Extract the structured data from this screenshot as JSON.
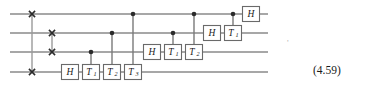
{
  "figure": {
    "kind": "quantum-circuit",
    "equation_number": "(4.59)",
    "stray_mark": "'",
    "wire_count": 4,
    "colors": {
      "wire": "#8a8a8a",
      "gate_border": "#6a6a6a",
      "gate_fill": "#ffffff",
      "control_dot": "#2b2b2b",
      "text": "#1a1a1a",
      "background": "#ffffff"
    },
    "wires": [
      {
        "index": 0,
        "y": 14
      },
      {
        "index": 1,
        "y": 33
      },
      {
        "index": 2,
        "y": 52
      },
      {
        "index": 3,
        "y": 72
      }
    ],
    "wire_span": {
      "x_start": 10,
      "x_end": 268
    },
    "swaps": [
      {
        "name": "swap-q0-q3",
        "x": 32,
        "wire_a": 0,
        "wire_b": 3
      },
      {
        "name": "swap-q1-q2",
        "x": 52,
        "wire_a": 1,
        "wire_b": 2
      }
    ],
    "gates": [
      {
        "id": "g-h-w3",
        "label": "H",
        "sub": "",
        "wire": 3,
        "x": 70,
        "control_wire": null
      },
      {
        "id": "g-t1-w3",
        "label": "T",
        "sub": "1",
        "wire": 3,
        "x": 91,
        "control_wire": 2
      },
      {
        "id": "g-t2-w3",
        "label": "T",
        "sub": "2",
        "wire": 3,
        "x": 112,
        "control_wire": 1
      },
      {
        "id": "g-t3-w3",
        "label": "T",
        "sub": "3",
        "wire": 3,
        "x": 133,
        "control_wire": 0
      },
      {
        "id": "g-h-w2",
        "label": "H",
        "sub": "",
        "wire": 2,
        "x": 152,
        "control_wire": null
      },
      {
        "id": "g-t1-w2",
        "label": "T",
        "sub": "1",
        "wire": 2,
        "x": 173,
        "control_wire": 1
      },
      {
        "id": "g-t2-w2",
        "label": "T",
        "sub": "2",
        "wire": 2,
        "x": 194,
        "control_wire": 0
      },
      {
        "id": "g-h-w1",
        "label": "H",
        "sub": "",
        "wire": 1,
        "x": 212,
        "control_wire": null
      },
      {
        "id": "g-t1-w1",
        "label": "T",
        "sub": "1",
        "wire": 1,
        "x": 233,
        "control_wire": 0
      },
      {
        "id": "g-h-w0",
        "label": "H",
        "sub": "",
        "wire": 0,
        "x": 251,
        "control_wire": null
      }
    ],
    "gate_box": {
      "width": 17,
      "height": 15
    }
  }
}
